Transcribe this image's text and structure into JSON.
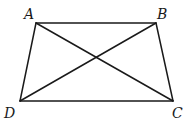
{
  "diagram": {
    "vertices": {
      "A": {
        "label": "A",
        "x": 36,
        "y": 23,
        "label_x": 24,
        "label_y": 19
      },
      "B": {
        "label": "B",
        "x": 156,
        "y": 23,
        "label_x": 157,
        "label_y": 19
      },
      "C": {
        "label": "C",
        "x": 173,
        "y": 101,
        "label_x": 172,
        "label_y": 118
      },
      "D": {
        "label": "D",
        "x": 20,
        "y": 101,
        "label_x": 4,
        "label_y": 118
      }
    },
    "edges": [
      {
        "name": "AB",
        "from": "A",
        "to": "B"
      },
      {
        "name": "BC",
        "from": "B",
        "to": "C"
      },
      {
        "name": "CD",
        "from": "C",
        "to": "D"
      },
      {
        "name": "DA",
        "from": "D",
        "to": "A"
      },
      {
        "name": "AC",
        "from": "A",
        "to": "C"
      },
      {
        "name": "BD",
        "from": "B",
        "to": "D"
      }
    ],
    "stroke_color": "#1a1a1a"
  }
}
